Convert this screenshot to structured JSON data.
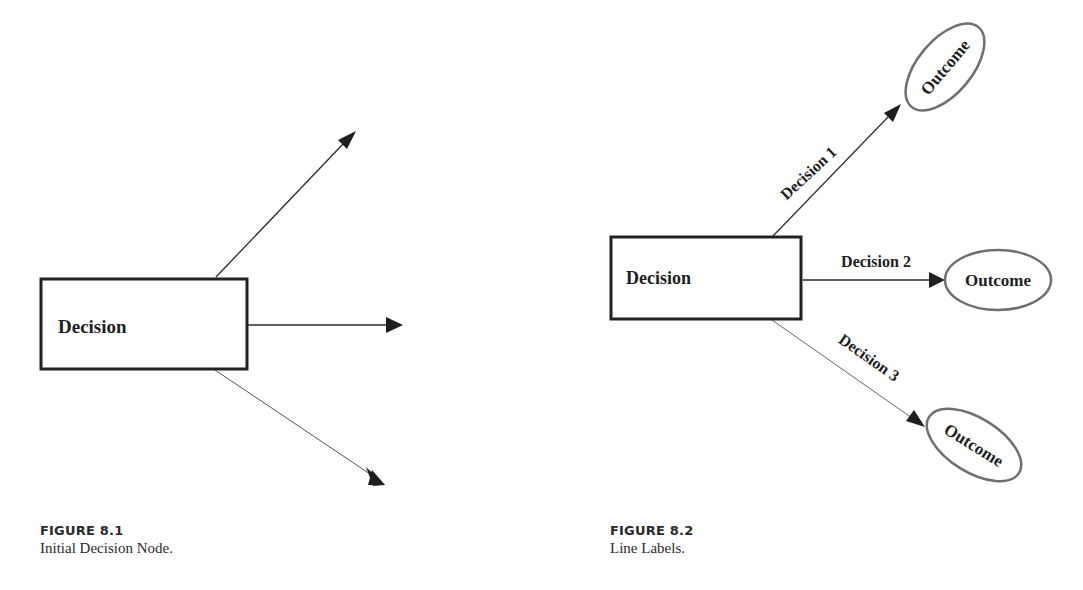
{
  "figures": [
    {
      "id": "fig-8-1",
      "caption": {
        "number": "FIGURE 8.1",
        "title": "Initial Decision Node."
      },
      "decision_node": {
        "label": "Decision"
      },
      "branches": [
        {
          "label": "",
          "direction": "up-right"
        },
        {
          "label": "",
          "direction": "right"
        },
        {
          "label": "",
          "direction": "down-right"
        }
      ]
    },
    {
      "id": "fig-8-2",
      "caption": {
        "number": "FIGURE 8.2",
        "title": "Line Labels."
      },
      "decision_node": {
        "label": "Decision"
      },
      "branches": [
        {
          "label": "Decision 1",
          "outcome": "Outcome",
          "direction": "up-right"
        },
        {
          "label": "Decision 2",
          "outcome": "Outcome",
          "direction": "right"
        },
        {
          "label": "Decision 3",
          "outcome": "Outcome",
          "direction": "down-right"
        }
      ]
    }
  ],
  "colors": {
    "line": "#2b2b2b",
    "box_border": "#222222",
    "ellipse_border": "#6f6f6f",
    "text": "#1e1e1e"
  }
}
